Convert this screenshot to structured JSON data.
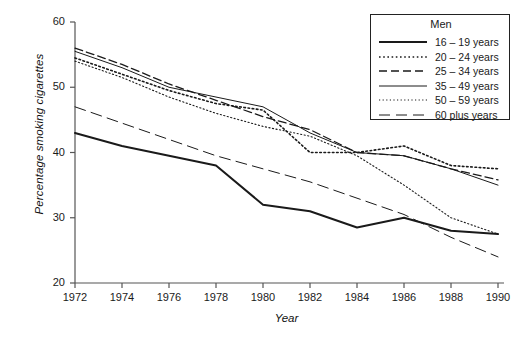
{
  "chart": {
    "type": "line",
    "title": "",
    "xlabel": "Year",
    "ylabel": "Percentage smoking cigarettes",
    "legend_title": "Men",
    "legend_position": "top-right",
    "grid": false,
    "xlim": [
      1972,
      1990
    ],
    "ylim": [
      20,
      60
    ],
    "x_ticks": [
      "1972",
      "1974",
      "1976",
      "1978",
      "1980",
      "1982",
      "1984",
      "1986",
      "1988",
      "1990"
    ],
    "y_ticks": [
      "20",
      "30",
      "40",
      "50",
      "60"
    ]
  },
  "chart_data": {
    "type": "line",
    "title": "",
    "xlabel": "Year",
    "ylabel": "Percentage smoking cigarettes",
    "legend_title": "Men",
    "legend_position": "top-right",
    "grid": false,
    "xlim": [
      1972,
      1990
    ],
    "ylim": [
      20,
      60
    ],
    "x": [
      1972,
      1974,
      1976,
      1978,
      1980,
      1982,
      1984,
      1986,
      1988,
      1990
    ],
    "series": [
      {
        "name": "16 – 19 years",
        "style": "solid-thick",
        "values": [
          43.0,
          41.0,
          39.5,
          38.0,
          32.0,
          31.0,
          28.5,
          30.0,
          28.0,
          27.5
        ]
      },
      {
        "name": "20 – 24 years",
        "style": "dotted",
        "values": [
          54.5,
          52.0,
          49.5,
          47.5,
          46.5,
          40.0,
          40.0,
          41.0,
          38.0,
          37.5
        ]
      },
      {
        "name": "25 – 34 years",
        "style": "dashed",
        "values": [
          56.0,
          53.5,
          50.5,
          48.0,
          45.5,
          43.5,
          40.0,
          39.5,
          37.5,
          35.8
        ]
      },
      {
        "name": "35 – 49 years",
        "style": "solid-thin",
        "values": [
          55.5,
          53.0,
          50.0,
          48.5,
          47.0,
          43.0,
          40.0,
          39.5,
          37.5,
          35.0
        ]
      },
      {
        "name": "50 – 59 years",
        "style": "dotted-fine",
        "values": [
          54.0,
          51.5,
          48.5,
          46.0,
          44.0,
          42.5,
          39.5,
          35.0,
          30.0,
          27.5
        ]
      },
      {
        "name": "60 plus years",
        "style": "dashed-long",
        "values": [
          47.0,
          44.5,
          42.0,
          39.5,
          37.5,
          35.5,
          33.0,
          30.5,
          27.0,
          24.0
        ]
      }
    ]
  },
  "legend": {
    "title": "Men",
    "entries": [
      {
        "label": "16 – 19 years",
        "style": "solid-thick"
      },
      {
        "label": "20 – 24 years",
        "style": "dotted"
      },
      {
        "label": "25 – 34 years",
        "style": "dashed"
      },
      {
        "label": "35 – 49 years",
        "style": "solid-thin"
      },
      {
        "label": "50 – 59 years",
        "style": "dotted-fine"
      },
      {
        "label": "60 plus years",
        "style": "dashed-long"
      }
    ]
  },
  "colors": {
    "line": "#1a1a1a",
    "axis": "#555555",
    "background": "#ffffff"
  }
}
